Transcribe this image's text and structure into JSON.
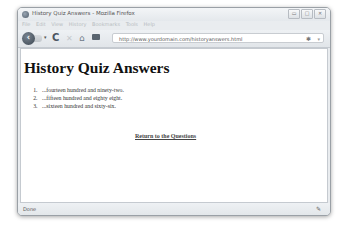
{
  "window": {
    "title": "History Quiz Answers - Mozilla Firefox",
    "controls": [
      "▭",
      "□",
      "✕"
    ]
  },
  "menubar": {
    "items": [
      "File",
      "Edit",
      "View",
      "History",
      "Bookmarks",
      "Tools",
      "Help"
    ]
  },
  "toolbar": {
    "back_icon": "‹",
    "reload_icon": "C",
    "stop_icon": "✕",
    "home_icon": "⌂",
    "url": "http://www.yourdomain.com/historyanswers.html",
    "star_icon": "✱",
    "dropdown_icon": "▾"
  },
  "page": {
    "heading": "History Quiz Answers",
    "answers": [
      "...fourteen hundred and ninety-two.",
      "...fifteen hundred and eighty eight.",
      "...sixteen hundred and sixty-six."
    ],
    "return_link": "Return to the Questions"
  },
  "statusbar": {
    "text": "Done",
    "icon": "✎"
  }
}
